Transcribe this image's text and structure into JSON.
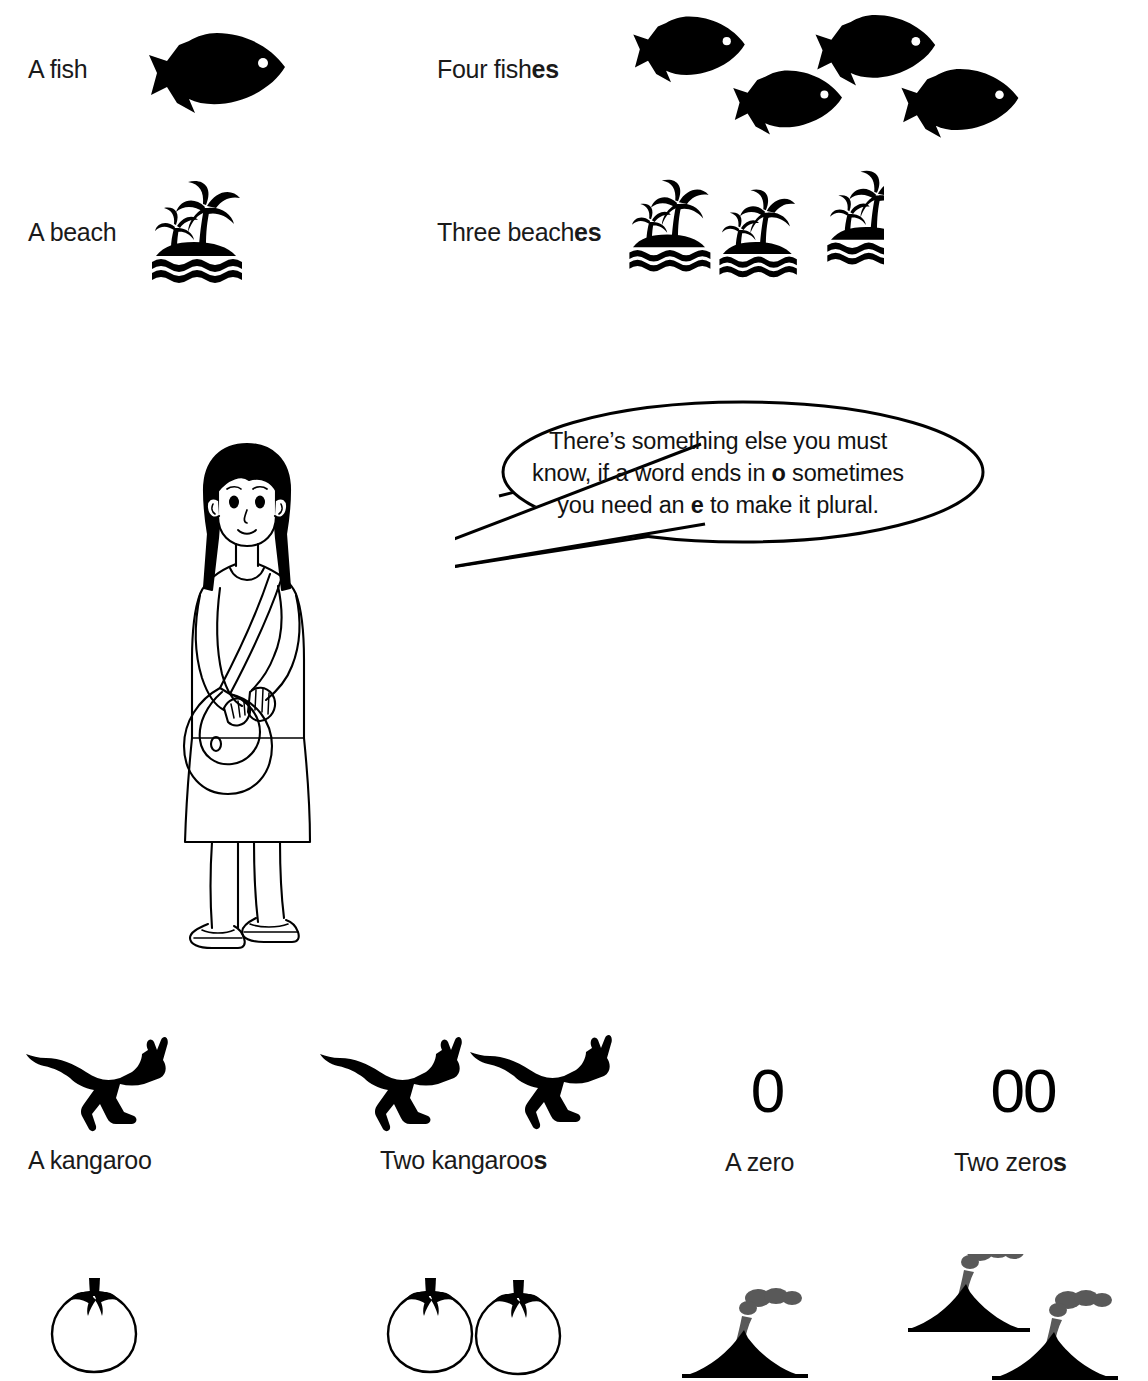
{
  "page": {
    "background_color": "#ffffff",
    "ink_color": "#000000",
    "smoke_color": "#595959"
  },
  "rows": {
    "fish": {
      "singular_label": "A fish",
      "plural_label_plain": "Four fish",
      "plural_label_suffix": "es",
      "singular_icon": "fish-icon",
      "plural_icon": "fish-icon",
      "singular_count": 1,
      "plural_count": 4
    },
    "beach": {
      "singular_label": "A beach",
      "plural_label_plain": "Three beach",
      "plural_label_suffix": "es",
      "singular_icon": "beach-island-icon",
      "plural_icon": "beach-island-icon",
      "singular_count": 1,
      "plural_count": 3
    },
    "kangaroo": {
      "singular_label": "A kangaroo",
      "plural_label_plain": "Two kangaroo",
      "plural_label_suffix": "s",
      "singular_icon": "kangaroo-icon",
      "plural_icon": "kangaroo-icon",
      "singular_count": 1,
      "plural_count": 2
    },
    "zero": {
      "singular_label": "A zero",
      "plural_label_plain": "Two zero",
      "plural_label_suffix": "s",
      "singular_icon": "zero-digit-glyph",
      "plural_icon": "zero-digit-glyph",
      "singular_value": "0",
      "plural_value": "00"
    },
    "tomato": {
      "singular_icon": "tomato-icon",
      "plural_icon": "tomato-icon",
      "singular_count": 1,
      "plural_count": 2
    },
    "volcano": {
      "singular_icon": "volcano-icon",
      "plural_icon": "volcano-icon",
      "singular_count": 1,
      "plural_count": 2
    }
  },
  "character": {
    "name": "girl-with-shoulder-bag",
    "description": "Line-art girl with long black hair wearing a dress and a shoulder bag"
  },
  "speech_bubble": {
    "name": "speech-bubble",
    "line1_a": "There’s something else you must",
    "line2_a": "know, if a word ends in ",
    "line2_bold": "o",
    "line2_b": " sometimes",
    "line3_a": "you need an ",
    "line3_bold": "e",
    "line3_b": " to make it plural.",
    "full_text": "There’s something else you must know, if a word ends in o sometimes you need an e to make it plural."
  }
}
